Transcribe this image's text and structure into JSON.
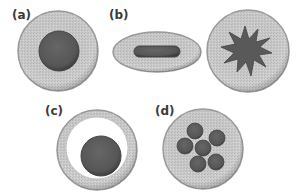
{
  "figure": {
    "panels": [
      {
        "id": "a",
        "label": "(a)",
        "description": "round cell with large central nucleus"
      },
      {
        "id": "b",
        "label": "(b)",
        "description": "elongated elliptical cell with rod nucleus; round cell with star-shaped nucleus"
      },
      {
        "id": "c",
        "label": "(c)",
        "description": "ring cell with eccentric nucleus and large clear vacuole"
      },
      {
        "id": "d",
        "label": "(d)",
        "description": "round cell with multilobed nucleus (6 lobes)"
      }
    ],
    "colors": {
      "cytoplasm": "#c9c9c9",
      "cytoplasm_edge": "#9a9a9a",
      "nucleus": "#5b5b5b",
      "nucleus_edge": "#3f3f3f",
      "vacuole": "#ffffff",
      "label": "#3a3a3a"
    }
  }
}
